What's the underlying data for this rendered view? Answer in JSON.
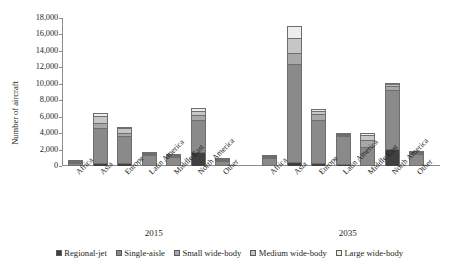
{
  "chart_data": {
    "type": "bar",
    "subtype": "stacked-grouped-column",
    "title": "",
    "xlabel": "",
    "ylabel": "Number of aircraft",
    "ylim": [
      0,
      18000
    ],
    "yticks": [
      "0",
      "2,000",
      "4,000",
      "6,000",
      "8,000",
      "10,000",
      "12,000",
      "14,000",
      "16,000",
      "18,000"
    ],
    "ytick_values": [
      0,
      2000,
      4000,
      6000,
      8000,
      10000,
      12000,
      14000,
      16000,
      18000
    ],
    "grid": false,
    "legend_position": "bottom",
    "groups": [
      "2015",
      "2035"
    ],
    "categories": [
      "Africa",
      "Asia",
      "Europe",
      "Latin America",
      "Middle East",
      "North America",
      "Other"
    ],
    "series": [
      {
        "name": "Regional-jet",
        "color": "#404040",
        "values_2015": [
          120,
          330,
          350,
          140,
          60,
          1750,
          100
        ],
        "values_2035": [
          150,
          450,
          400,
          200,
          120,
          2100,
          150
        ]
      },
      {
        "name": "Single-aisle",
        "color": "#8a8a8a",
        "values_2015": [
          480,
          4300,
          3250,
          1330,
          1050,
          3800,
          760
        ],
        "values_2035": [
          1050,
          11900,
          5200,
          3450,
          2250,
          7100,
          1450
        ]
      },
      {
        "name": "Small wide-body",
        "color": "#a8a8a8",
        "values_2015": [
          60,
          600,
          450,
          100,
          180,
          700,
          70
        ],
        "values_2035": [
          90,
          1350,
          700,
          180,
          820,
          500,
          120
        ]
      },
      {
        "name": "Medium wide-body",
        "color": "#c6c6c6",
        "values_2015": [
          40,
          800,
          530,
          60,
          130,
          500,
          50
        ],
        "values_2035": [
          70,
          1900,
          400,
          130,
          580,
          300,
          100
        ]
      },
      {
        "name": "Large wide-body",
        "color": "#ededed",
        "values_2015": [
          20,
          420,
          130,
          30,
          100,
          250,
          30
        ],
        "values_2035": [
          40,
          1450,
          200,
          60,
          250,
          120,
          60
        ]
      }
    ],
    "totals_2015": [
      720,
      6450,
      4710,
      1660,
      1520,
      7000,
      1010
    ],
    "totals_2035": [
      1400,
      17050,
      6900,
      4020,
      4020,
      10120,
      1880
    ]
  },
  "legend": {
    "items": [
      {
        "label": "Regional-jet"
      },
      {
        "label": "Single-aisle"
      },
      {
        "label": "Small wide-body"
      },
      {
        "label": "Medium wide-body"
      },
      {
        "label": "Large wide-body"
      }
    ]
  }
}
